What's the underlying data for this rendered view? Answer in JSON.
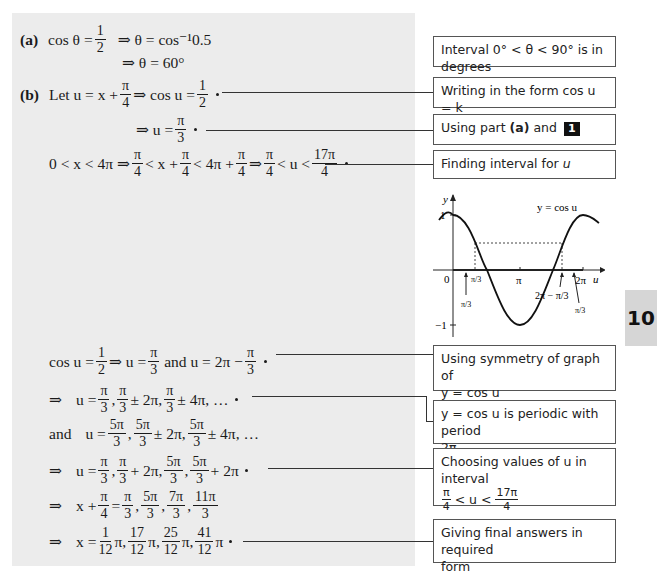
{
  "worked_solution": {
    "part_a": {
      "label": "(a)",
      "line1_lhs": "cos θ =",
      "line1_frac": {
        "num": "1",
        "den": "2"
      },
      "line1_rhs": "⇒ θ = cos⁻¹0.5",
      "line2": "⇒ θ = 60°"
    },
    "part_b": {
      "label": "(b)",
      "line1_pre": "Let u = x +",
      "line1_frac1": {
        "num": "π",
        "den": "4"
      },
      "line1_mid": "⇒ cos u =",
      "line1_frac2": {
        "num": "1",
        "den": "2"
      },
      "line2_pre": "⇒ u =",
      "line2_frac": {
        "num": "π",
        "den": "3"
      },
      "line3": {
        "p1": "0 < x < 4π ⇒",
        "f1": {
          "num": "π",
          "den": "4"
        },
        "p2": "< x +",
        "f2": {
          "num": "π",
          "den": "4"
        },
        "p3": "< 4π +",
        "f3": {
          "num": "π",
          "den": "4"
        },
        "p4": "⇒",
        "f4": {
          "num": "π",
          "den": "4"
        },
        "p5": "< u <",
        "f5": {
          "num": "17π",
          "den": "4"
        }
      },
      "line4": {
        "p1": "cos u =",
        "f1": {
          "num": "1",
          "den": "2"
        },
        "p2": "⇒ u =",
        "f2": {
          "num": "π",
          "den": "3"
        },
        "p3": "and u = 2π −",
        "f3": {
          "num": "π",
          "den": "3"
        }
      },
      "line5": {
        "arrow": "⇒",
        "p1": "u =",
        "f1": {
          "num": "π",
          "den": "3"
        },
        "f2": {
          "num": "π",
          "den": "3"
        },
        "p2": "± 2π,",
        "f3": {
          "num": "π",
          "den": "3"
        },
        "p3": "± 4π, …"
      },
      "line6": {
        "and": "and",
        "p1": "u =",
        "f1": {
          "num": "5π",
          "den": "3"
        },
        "f2": {
          "num": "5π",
          "den": "3"
        },
        "p2": "± 2π,",
        "f3": {
          "num": "5π",
          "den": "3"
        },
        "p3": "± 4π, …"
      },
      "line7": {
        "arrow": "⇒",
        "p1": "u =",
        "f1": {
          "num": "π",
          "den": "3"
        },
        "f2": {
          "num": "π",
          "den": "3"
        },
        "p2": "+ 2π,",
        "f3": {
          "num": "5π",
          "den": "3"
        },
        "f4": {
          "num": "5π",
          "den": "3"
        },
        "p3": "+ 2π"
      },
      "line8": {
        "arrow": "⇒",
        "p1": "x +",
        "f0": {
          "num": "π",
          "den": "4"
        },
        "p2": "=",
        "f1": {
          "num": "π",
          "den": "3"
        },
        "f2": {
          "num": "5π",
          "den": "3"
        },
        "f3": {
          "num": "7π",
          "den": "3"
        },
        "f4": {
          "num": "11π",
          "den": "3"
        }
      },
      "line9": {
        "arrow": "⇒",
        "p1": "x =",
        "f1": {
          "num": "1",
          "den": "12"
        },
        "f2": {
          "num": "17",
          "den": "12"
        },
        "f3": {
          "num": "25",
          "den": "12"
        },
        "f4": {
          "num": "41",
          "den": "12"
        },
        "pi": "π"
      }
    }
  },
  "annotations": [
    {
      "text": "Interval 0° < θ < 90° is in degrees"
    },
    {
      "text": "Writing in the form cos u = k"
    },
    {
      "pre": "Using part",
      "bold": "(a)",
      "post": "and",
      "badge": "1"
    },
    {
      "pre": "Finding interval for",
      "var": "u"
    },
    {
      "line1": "Using symmetry of graph of",
      "line2": "y = cos u"
    },
    {
      "line1": "y = cos u is periodic with period",
      "line2": "2π"
    },
    {
      "line1": "Choosing values of u in interval",
      "frac1": {
        "num": "π",
        "den": "4"
      },
      "mid": "< u <",
      "frac2": {
        "num": "17π",
        "den": "4"
      }
    },
    {
      "line1": "Giving final answers in required",
      "line2": "form"
    }
  ],
  "graph": {
    "y_label": "y",
    "x_label": "u",
    "curve_label": "y = cos u",
    "y_ticks": [
      "1",
      "−1"
    ],
    "origin": "0",
    "x_ticks": [
      "π/3",
      "π",
      "2π"
    ],
    "arrow_labels": [
      "π/3",
      "2π − π/3",
      "π/3"
    ]
  },
  "chapter_tab": "10"
}
